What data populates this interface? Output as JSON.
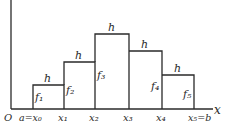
{
  "diagram": {
    "origin_label": "O",
    "x_axis_label": "x",
    "x_ticks": [
      "a=x₀",
      "x₁",
      "x₂",
      "x₃",
      "x₄",
      "x₅=b"
    ],
    "rectangles": [
      {
        "height_label": "f₁",
        "width_label": "h",
        "x0": 33,
        "x1": 64,
        "top": 85
      },
      {
        "height_label": "f₂",
        "width_label": "h",
        "x0": 64,
        "x1": 95,
        "top": 62
      },
      {
        "height_label": "f₃",
        "width_label": "h",
        "x0": 95,
        "x1": 129,
        "top": 34
      },
      {
        "height_label": "f₄",
        "width_label": "h",
        "x0": 129,
        "x1": 162,
        "top": 51
      },
      {
        "height_label": "f₅",
        "width_label": "h",
        "x0": 162,
        "x1": 194,
        "top": 75
      }
    ],
    "line_color": "#2a2a2a"
  }
}
